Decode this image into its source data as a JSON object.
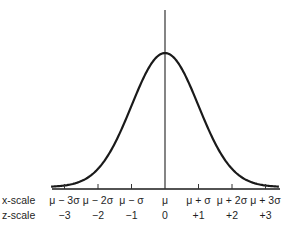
{
  "diagram": {
    "type": "normal-curve",
    "colors": {
      "stroke": "#1a1a1a",
      "background": "#ffffff"
    },
    "rows": {
      "x_scale_label": "x-scale",
      "z_scale_label": "z-scale"
    },
    "ticks": [
      {
        "z": -3,
        "x_label": "μ − 3σ",
        "z_label": "−3"
      },
      {
        "z": -2,
        "x_label": "μ − 2σ",
        "z_label": "−2"
      },
      {
        "z": -1,
        "x_label": "μ − σ",
        "z_label": "−1"
      },
      {
        "z": 0,
        "x_label": "μ",
        "z_label": "0"
      },
      {
        "z": 1,
        "x_label": "μ + σ",
        "z_label": "+1"
      },
      {
        "z": 2,
        "x_label": "μ + 2σ",
        "z_label": "+2"
      },
      {
        "z": 3,
        "x_label": "μ + 3σ",
        "z_label": "+3"
      }
    ],
    "z_range": [
      -3.4,
      3.4
    ],
    "mean_line": true
  }
}
